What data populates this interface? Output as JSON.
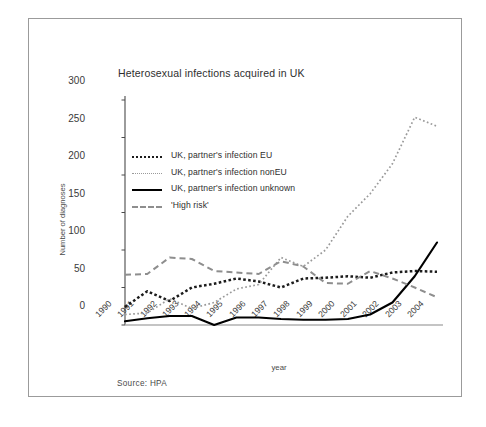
{
  "figure": {
    "title": "Heterosexual infections acquired in UK",
    "source": "Source: HPA"
  },
  "chart_data": {
    "type": "line",
    "title": "Heterosexual infections acquired in UK",
    "xlabel": "year",
    "ylabel": "Number of diagnoses",
    "ylim": [
      0,
      300
    ],
    "yticks": [
      0,
      50,
      100,
      150,
      200,
      250,
      300
    ],
    "grid": false,
    "legend_position": "upper-left-inside",
    "categories": [
      "1990",
      "1991",
      "1992",
      "1993",
      "1994",
      "1995",
      "1996",
      "1997",
      "1998",
      "1999",
      "2000",
      "2001",
      "2002",
      "2003",
      "2004"
    ],
    "series": [
      {
        "name": "UK, partner's infection EU",
        "style": "dotted-thick",
        "color": "#1c1c1c",
        "values": [
          24,
          45,
          32,
          50,
          55,
          62,
          58,
          50,
          62,
          63,
          65,
          63,
          70,
          72,
          71
        ]
      },
      {
        "name": "UK, partner's infection nonEU",
        "style": "dotted-fine",
        "color": "#9a9a9a",
        "values": [
          14,
          16,
          35,
          22,
          30,
          48,
          54,
          90,
          78,
          100,
          145,
          175,
          215,
          277,
          265
        ]
      },
      {
        "name": "UK, partner's infection unknown",
        "style": "solid",
        "color": "#000000",
        "values": [
          5,
          9,
          12,
          12,
          0,
          10,
          10,
          8,
          7,
          7,
          8,
          14,
          30,
          65,
          110
        ]
      },
      {
        "name": "'High risk'",
        "style": "dashed",
        "color": "#8e8e8e",
        "values": [
          67,
          68,
          90,
          88,
          72,
          70,
          68,
          85,
          78,
          56,
          55,
          72,
          62,
          50,
          37
        ]
      }
    ]
  },
  "legend": {
    "items": [
      {
        "label": "UK, partner's infection EU"
      },
      {
        "label": "UK, partner's infection nonEU"
      },
      {
        "label": "UK, partner's infection unknown"
      },
      {
        "label": "'High risk'"
      }
    ]
  }
}
